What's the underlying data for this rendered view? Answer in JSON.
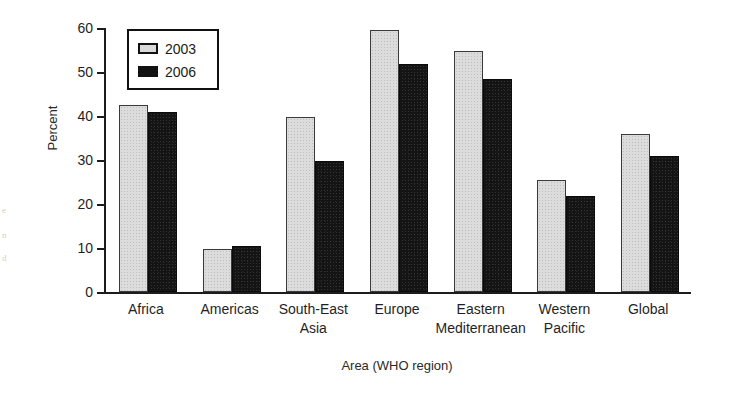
{
  "chart_data": {
    "type": "bar",
    "title": "",
    "xlabel": "Area (WHO region)",
    "ylabel": "Percent",
    "ylim": [
      0,
      60
    ],
    "ytick_step": 10,
    "yticks": [
      "0",
      "10",
      "20",
      "30",
      "40",
      "50",
      "60"
    ],
    "grid": false,
    "legend_position": "top-left inside plot",
    "categories": [
      "Africa",
      "Americas",
      "South-East\nAsia",
      "Europe",
      "Eastern\nMediterranean",
      "Western\nPacific",
      "Global"
    ],
    "category_lines": [
      [
        "Africa"
      ],
      [
        "Americas"
      ],
      [
        "South-East",
        "Asia"
      ],
      [
        "Europe"
      ],
      [
        "Eastern",
        "Mediterranean"
      ],
      [
        "Western",
        "Pacific"
      ],
      [
        "Global"
      ]
    ],
    "series": [
      {
        "name": "2003",
        "color": "#dcdcdc",
        "values": [
          42.6,
          9.8,
          39.8,
          59.5,
          54.8,
          25.5,
          35.8
        ]
      },
      {
        "name": "2006",
        "color": "#141414",
        "values": [
          40.8,
          10.4,
          29.8,
          51.9,
          48.3,
          21.8,
          30.8
        ]
      }
    ]
  },
  "legend": {
    "entries": [
      {
        "label": "2003",
        "swatch": "light"
      },
      {
        "label": "2006",
        "swatch": "dark"
      }
    ]
  },
  "artifacts": {
    "edge_marks": [
      "e",
      "n",
      "d"
    ]
  }
}
